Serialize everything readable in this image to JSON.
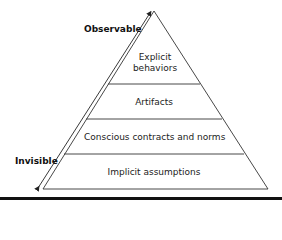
{
  "diagram": {
    "axis": {
      "top_label": "Observable",
      "bottom_label": "Invisible"
    },
    "levels": [
      {
        "label_line1": "Explicit",
        "label_line2": "behaviors"
      },
      {
        "label": "Artifacts"
      },
      {
        "label": "Conscious contracts and norms"
      },
      {
        "label": "Implicit assumptions"
      }
    ],
    "colors": {
      "line": "#333333",
      "text": "#222222",
      "background": "#ffffff"
    }
  }
}
